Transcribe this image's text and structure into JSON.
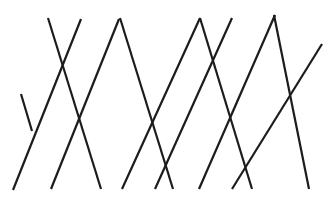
{
  "figure": {
    "title": "",
    "caption": "",
    "background_color": "#ffffff",
    "line_color": "#1c1c1c",
    "line_width": 2.2,
    "line_cap": "butt",
    "width": 336,
    "height": 204
  },
  "chart_data": {
    "type": "line",
    "title": "",
    "xlabel": "",
    "ylabel": "",
    "xlim": [
      0,
      336
    ],
    "ylim": [
      0,
      204
    ],
    "grid": false,
    "legend": "none",
    "series": [
      {
        "name": "descending-line-1",
        "direction": "down-right",
        "x": [
          48,
          101
        ],
        "y": [
          18,
          189
        ]
      },
      {
        "name": "descending-line-2",
        "direction": "down-right",
        "x": [
          120,
          173
        ],
        "y": [
          18,
          189
        ]
      },
      {
        "name": "descending-line-3",
        "direction": "down-right",
        "x": [
          200,
          252
        ],
        "y": [
          18,
          189
        ]
      },
      {
        "name": "descending-line-4",
        "direction": "down-right",
        "x": [
          274,
          309
        ],
        "y": [
          15,
          189
        ]
      },
      {
        "name": "descending-line-short-left",
        "direction": "down-right",
        "x": [
          21,
          32
        ],
        "y": [
          94,
          131
        ]
      },
      {
        "name": "ascending-line-1",
        "direction": "up-right",
        "x": [
          51,
          119
        ],
        "y": [
          189,
          19
        ]
      },
      {
        "name": "ascending-line-2",
        "direction": "up-right",
        "x": [
          13,
          81
        ],
        "y": [
          190,
          19
        ]
      },
      {
        "name": "ascending-line-3",
        "direction": "up-right",
        "x": [
          122,
          200
        ],
        "y": [
          189,
          18
        ]
      },
      {
        "name": "ascending-line-4",
        "direction": "up-right",
        "x": [
          155,
          232
        ],
        "y": [
          189,
          18
        ]
      },
      {
        "name": "ascending-line-5",
        "direction": "up-right",
        "x": [
          199,
          275
        ],
        "y": [
          189,
          15
        ]
      },
      {
        "name": "ascending-line-6",
        "direction": "up-right",
        "x": [
          232,
          322
        ],
        "y": [
          189,
          44
        ]
      }
    ]
  }
}
